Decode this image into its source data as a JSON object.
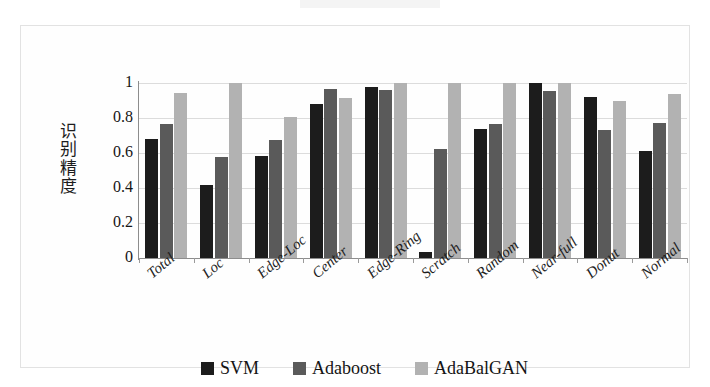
{
  "chart_data": {
    "type": "bar",
    "title": "",
    "subtitle": "",
    "xlabel": "",
    "ylabel": "识别精度",
    "ylim": [
      0,
      1
    ],
    "yticks": [
      "0",
      "0.2",
      "0.4",
      "0.6",
      "0.8",
      "1"
    ],
    "ytick_values": [
      0,
      0.2,
      0.4,
      0.6,
      0.8,
      1
    ],
    "grid": true,
    "legend_position": "bottom",
    "categories": [
      "Total",
      "Loc",
      "Edge-Loc",
      "Center",
      "Edge-Ring",
      "Scratch",
      "Random",
      "Near-full",
      "Donut",
      "Normal"
    ],
    "series": [
      {
        "name": "SVM",
        "color": "#1c1c1c",
        "values": [
          0.68,
          0.42,
          0.585,
          0.88,
          0.975,
          0.035,
          0.735,
          1.0,
          0.92,
          0.61
        ]
      },
      {
        "name": "Adaboost",
        "color": "#5a5a5a",
        "values": [
          0.765,
          0.58,
          0.675,
          0.965,
          0.96,
          0.625,
          0.765,
          0.955,
          0.73,
          0.77
        ]
      },
      {
        "name": "AdaBalGAN",
        "color": "#b2b2b2",
        "values": [
          0.945,
          1.0,
          0.805,
          0.915,
          1.0,
          1.0,
          1.0,
          1.0,
          0.9,
          0.94
        ]
      }
    ]
  },
  "y_axis_title_chars": [
    "识",
    "别",
    "精",
    "度"
  ],
  "legend": {
    "entries": [
      {
        "label": "SVM",
        "swatch": "svm"
      },
      {
        "label": "Adaboost",
        "swatch": "adaboost"
      },
      {
        "label": "AdaBalGAN",
        "swatch": "adabal"
      }
    ]
  }
}
